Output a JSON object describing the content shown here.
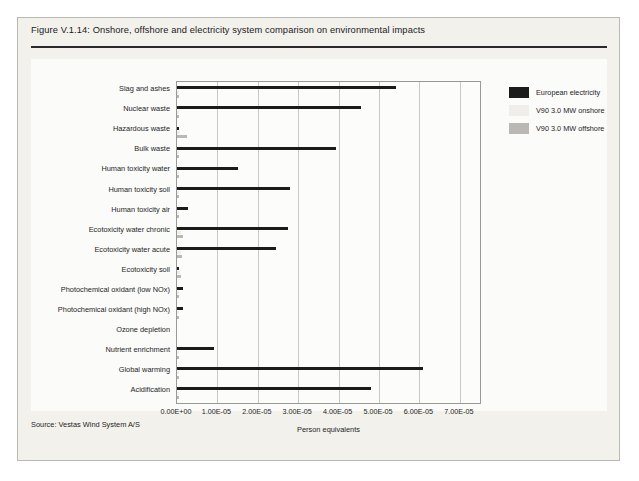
{
  "figure": {
    "title": "Figure V.1.14: Onshore, offshore and electricity system comparison on environmental impacts",
    "source": "Source: Vestas Wind System A/S"
  },
  "legend": {
    "position": "top-right",
    "items": [
      {
        "label": "European electricity",
        "color": "#1b1b1b",
        "key": "european_electricity"
      },
      {
        "label": "V90 3.0 MW onshore",
        "color": "#efeeea",
        "key": "v90_onshore"
      },
      {
        "label": "V90 3.0 MW offshore",
        "color": "#b9b8b4",
        "key": "v90_offshore"
      }
    ]
  },
  "axis": {
    "x_ticks": [
      "0.00E+00",
      "1.00E-05",
      "2.00E-05",
      "3.00E-05",
      "4.00E-05",
      "5.00E-05",
      "6.00E-05",
      "7.00E-05"
    ],
    "x_title": "Person equivalents"
  },
  "chart_data": {
    "type": "bar",
    "orientation": "horizontal",
    "title": "Figure V.1.14: Onshore, offshore and electricity system comparison on environmental impacts",
    "xlabel": "Person equivalents",
    "ylabel": "",
    "xlim": [
      0,
      7.5e-05
    ],
    "xticks": [
      0,
      1e-05,
      2e-05,
      3e-05,
      4e-05,
      5e-05,
      6e-05,
      7e-05
    ],
    "grid": true,
    "legend_position": "top-right",
    "categories": [
      "Slag and ashes",
      "Nuclear waste",
      "Hazardous waste",
      "Bulk waste",
      "Human toxicity water",
      "Human toxicity soil",
      "Human toxicity air",
      "Ecotoxicity water chronic",
      "Ecotoxicity water acute",
      "Ecotoxicity soil",
      "Photochemical oxidant (low NOx)",
      "Photochemical oxidant (high NOx)",
      "Ozone depletion",
      "Nutrient enrichment",
      "Global warming",
      "Acidification"
    ],
    "series": [
      {
        "name": "European electricity",
        "color": "#1b1b1b",
        "values": [
          5.41e-05,
          4.55e-05,
          6e-07,
          3.93e-05,
          1.52e-05,
          2.79e-05,
          2.7e-06,
          2.75e-05,
          2.45e-05,
          3e-07,
          1.6e-06,
          1.6e-06,
          0.0,
          9.2e-06,
          6.1e-05,
          4.79e-05
        ]
      },
      {
        "name": "V90 3.0 MW onshore",
        "color": "#efeeea",
        "values": [
          4e-07,
          3e-07,
          8e-07,
          3e-07,
          2e-07,
          4e-07,
          2e-07,
          1e-06,
          9e-07,
          7e-07,
          1e-07,
          1e-07,
          0.0,
          2e-07,
          3e-07,
          3e-07
        ]
      },
      {
        "name": "V90 3.0 MW offshore",
        "color": "#b9b8b4",
        "values": [
          5e-07,
          4e-07,
          2.5e-06,
          4e-07,
          3e-07,
          5e-07,
          3e-07,
          1.4e-06,
          1.2e-06,
          1e-06,
          1.5e-07,
          1.5e-07,
          0.0,
          3e-07,
          4e-07,
          4e-07
        ]
      }
    ]
  }
}
